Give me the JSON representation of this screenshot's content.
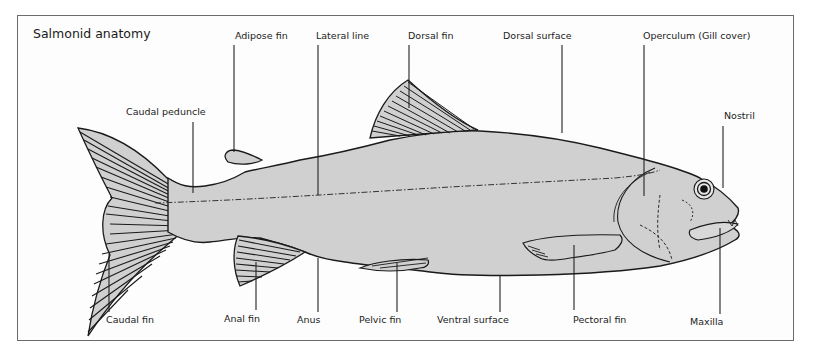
{
  "diagram": {
    "title": "Salmonid anatomy",
    "colors": {
      "background": "#fdfdfd",
      "frame": "#6b6b6b",
      "body_fill": "#d0d0d0",
      "outline": "#1a1a1a",
      "text": "#222222"
    },
    "labels_top": [
      {
        "id": "adipose-fin",
        "text": "Adipose fin"
      },
      {
        "id": "lateral-line",
        "text": "Lateral line"
      },
      {
        "id": "dorsal-fin",
        "text": "Dorsal fin"
      },
      {
        "id": "dorsal-surface",
        "text": "Dorsal surface"
      },
      {
        "id": "operculum",
        "text": "Operculum (Gill cover)"
      }
    ],
    "labels_mid": [
      {
        "id": "caudal-peduncle",
        "text": "Caudal peduncle"
      },
      {
        "id": "nostril",
        "text": "Nostril"
      }
    ],
    "labels_bottom": [
      {
        "id": "caudal-fin",
        "text": "Caudal fin"
      },
      {
        "id": "anal-fin",
        "text": "Anal fin"
      },
      {
        "id": "anus",
        "text": "Anus"
      },
      {
        "id": "pelvic-fin",
        "text": "Pelvic fin"
      },
      {
        "id": "ventral-surface",
        "text": "Ventral surface"
      },
      {
        "id": "pectoral-fin",
        "text": "Pectoral fin"
      },
      {
        "id": "maxilla",
        "text": "Maxilla"
      }
    ]
  }
}
